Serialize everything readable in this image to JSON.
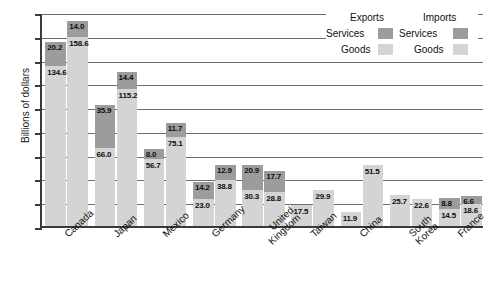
{
  "chart_data": {
    "type": "bar",
    "title": "",
    "xlabel": "",
    "ylabel": "Billions of dollars",
    "ylim": [
      0,
      180
    ],
    "yticks": [
      0,
      20,
      40,
      60,
      80,
      100,
      120,
      140,
      160,
      180
    ],
    "grid": true,
    "stacked": true,
    "legend_position": "top-right",
    "legend": {
      "columns": [
        "Exports",
        "Imports"
      ],
      "rows": [
        "Services",
        "Goods"
      ],
      "colors": {
        "services": "#9c9c9c",
        "goods": "#d4d4d4"
      }
    },
    "categories": [
      "Canada",
      "Japan",
      "Mexico",
      "Germany",
      "United Kingdom",
      "Taiwan",
      "China",
      "South Korea",
      "France"
    ],
    "series": [
      {
        "name": "Exports Goods",
        "values": [
          134.6,
          66.0,
          56.7,
          23.0,
          30.3,
          17.5,
          11.9,
          25.7,
          14.5
        ]
      },
      {
        "name": "Exports Services",
        "values": [
          20.2,
          35.9,
          8.0,
          14.2,
          20.9,
          null,
          null,
          null,
          8.8
        ]
      },
      {
        "name": "Imports Goods",
        "values": [
          158.6,
          115.2,
          75.1,
          38.8,
          28.8,
          29.9,
          51.5,
          22.6,
          18.6
        ]
      },
      {
        "name": "Imports Services",
        "values": [
          14.0,
          14.4,
          11.7,
          12.9,
          17.7,
          null,
          null,
          null,
          6.6
        ]
      }
    ],
    "bars": [
      {
        "category": "Canada",
        "exports": {
          "goods": 134.6,
          "services": 20.2
        },
        "imports": {
          "goods": 158.6,
          "services": 14.0
        }
      },
      {
        "category": "Japan",
        "exports": {
          "goods": 66.0,
          "services": 35.9
        },
        "imports": {
          "goods": 115.2,
          "services": 14.4
        }
      },
      {
        "category": "Mexico",
        "exports": {
          "goods": 56.7,
          "services": 8.0
        },
        "imports": {
          "goods": 75.1,
          "services": 11.7
        }
      },
      {
        "category": "Germany",
        "exports": {
          "goods": 23.0,
          "services": 14.2
        },
        "imports": {
          "goods": 38.8,
          "services": 12.9
        }
      },
      {
        "category": "United Kingdom",
        "exports": {
          "goods": 30.3,
          "services": 20.9
        },
        "imports": {
          "goods": 28.8,
          "services": 17.7
        }
      },
      {
        "category": "Taiwan",
        "exports": {
          "goods": 17.5,
          "services": null
        },
        "imports": {
          "goods": 29.9,
          "services": null
        }
      },
      {
        "category": "China",
        "exports": {
          "goods": 11.9,
          "services": null
        },
        "imports": {
          "goods": 51.5,
          "services": null
        }
      },
      {
        "category": "South Korea",
        "exports": {
          "goods": 25.7,
          "services": null
        },
        "imports": {
          "goods": 22.6,
          "services": null
        }
      },
      {
        "category": "France",
        "exports": {
          "goods": 14.5,
          "services": 8.8
        },
        "imports": {
          "goods": 18.6,
          "services": 6.6
        }
      }
    ],
    "category_lines": [
      [
        "Canada"
      ],
      [
        "Japan"
      ],
      [
        "Mexico"
      ],
      [
        "Germany"
      ],
      [
        "United",
        "Kingdom"
      ],
      [
        "Taiwan"
      ],
      [
        "China"
      ],
      [
        "South",
        "Korea"
      ],
      [
        "France"
      ]
    ]
  }
}
